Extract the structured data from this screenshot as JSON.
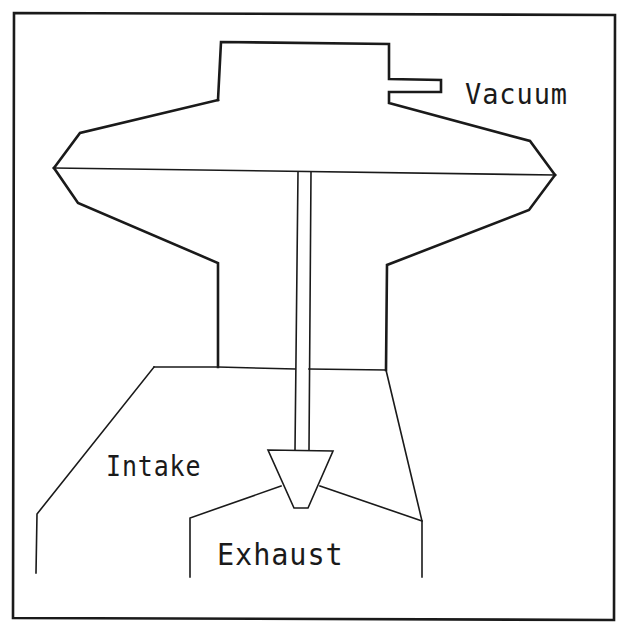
{
  "diagram": {
    "type": "cross-section schematic",
    "colors": {
      "background": "#ffffff",
      "stroke": "#1a1a1a"
    },
    "labels": {
      "vacuum": "Vacuum",
      "intake": "Intake",
      "exhaust": "Exhaust"
    },
    "components": [
      {
        "id": "frame",
        "description": "outer border"
      },
      {
        "id": "vacuum-chamber",
        "description": "upper housing with vacuum port tab"
      },
      {
        "id": "diaphragm",
        "description": "horizontal divider across chamber"
      },
      {
        "id": "valve-stem",
        "description": "vertical rod from diaphragm down to valve"
      },
      {
        "id": "valve-head",
        "description": "inverted trapezoid valve poppet"
      },
      {
        "id": "intake-passage",
        "description": "left lower passage"
      },
      {
        "id": "exhaust-passage",
        "description": "lower right outlet passage"
      }
    ]
  }
}
